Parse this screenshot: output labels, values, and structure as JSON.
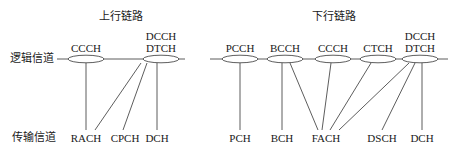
{
  "uplink": {
    "title": "上行链路",
    "logical_channels": [
      "CCCH",
      "DCCH\nDTCH"
    ],
    "transport_channels": [
      "RACH",
      "CPCH",
      "DCH"
    ]
  },
  "downlink": {
    "title": "下行链路",
    "logical_channels": [
      "PCCH",
      "BCCH",
      "CCCH",
      "CTCH",
      "DCCH\nDTCH"
    ],
    "transport_channels": [
      "PCH",
      "BCH",
      "FACH",
      "DSCH",
      "DCH"
    ]
  },
  "row_labels": {
    "logical": "逻辑信道",
    "transport": "传输信道"
  },
  "labels": {
    "ul_ccch": "CCCH",
    "ul_dcch": "DCCH",
    "ul_dtch": "DTCH",
    "dl_pcch": "PCCH",
    "dl_bcch": "BCCH",
    "dl_ccch": "CCCH",
    "dl_ctch": "CTCH",
    "dl_dcch": "DCCH",
    "dl_dtch": "DTCH",
    "ul_rach": "RACH",
    "ul_cpch": "CPCH",
    "ul_dch": "DCH",
    "dl_pch": "PCH",
    "dl_bch": "BCH",
    "dl_fach": "FACH",
    "dl_dsch": "DSCH",
    "dl_dch": "DCH"
  },
  "mappings": {
    "uplink": [
      [
        "CCCH",
        "RACH"
      ],
      [
        "DCCH/DTCH",
        "RACH"
      ],
      [
        "DCCH/DTCH",
        "CPCH"
      ],
      [
        "DCCH/DTCH",
        "DCH"
      ]
    ],
    "downlink": [
      [
        "PCCH",
        "PCH"
      ],
      [
        "BCCH",
        "BCH"
      ],
      [
        "BCCH",
        "FACH"
      ],
      [
        "CCCH",
        "FACH"
      ],
      [
        "CTCH",
        "FACH"
      ],
      [
        "DCCH/DTCH",
        "FACH"
      ],
      [
        "DCCH/DTCH",
        "DSCH"
      ],
      [
        "DCCH/DTCH",
        "DCH"
      ]
    ]
  }
}
